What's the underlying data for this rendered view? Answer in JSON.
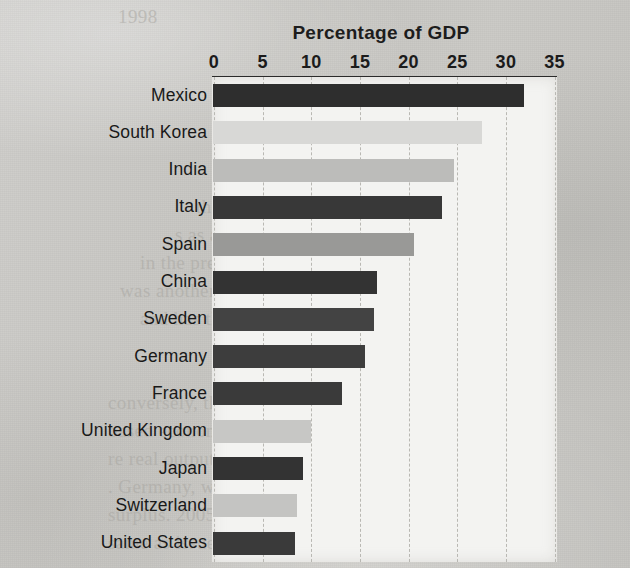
{
  "page": {
    "background_color": "#c9c8c4",
    "plot_background_color": "#f3f3f1",
    "axis_rule_color": "#2b2b2b",
    "gridline_color": "#b9b8b3"
  },
  "bleed_through_text": [
    {
      "text": "1998",
      "x": 118,
      "y": 6
    },
    {
      "text": "is in which economic",
      "x": 300,
      "y": 168
    },
    {
      "text": "the sources of growth in",
      "x": 196,
      "y": 196
    },
    {
      "text": "s as a proportion of GDP",
      "x": 175,
      "y": 224
    },
    {
      "text": "in the previous decade. In Germany, Ch",
      "x": 140,
      "y": 252
    },
    {
      "text": "was another record year for investment. 2005 repr",
      "x": 120,
      "y": 280
    },
    {
      "text": "and has the fastest domestic savings rate",
      "x": 140,
      "y": 308
    },
    {
      "text": "Figure 3",
      "x": 240,
      "y": 336
    },
    {
      "text": "conversely, the rise in investment spending",
      "x": 108,
      "y": 392
    },
    {
      "text": "based economy, DP growth",
      "x": 108,
      "y": 420
    },
    {
      "text": "re real output. So the gap",
      "x": 108,
      "y": 448
    },
    {
      "text": ". Germany, where growth in",
      "x": 108,
      "y": 476
    },
    {
      "text": "surplus. 2005 prices have",
      "x": 108,
      "y": 504
    },
    {
      "text": "same as issues of world",
      "x": 108,
      "y": 532
    }
  ],
  "chart_data": {
    "type": "bar",
    "orientation": "horizontal",
    "title": "Percentage of GDP",
    "xlabel": "",
    "ylabel": "",
    "xlim": [
      0,
      35
    ],
    "xticks": [
      0,
      5,
      10,
      15,
      20,
      25,
      30,
      35
    ],
    "xtick_labels": [
      "0",
      "5",
      "10",
      "15",
      "20",
      "25",
      "30",
      "35"
    ],
    "grid": "vertical-dashed",
    "legend": "none",
    "categories": [
      "Mexico",
      "South Korea",
      "India",
      "Italy",
      "Spain",
      "China",
      "Sweden",
      "Germany",
      "France",
      "United Kingdom",
      "Japan",
      "Switzerland",
      "United States"
    ],
    "values": [
      32.0,
      27.6,
      24.8,
      23.5,
      20.7,
      16.9,
      16.5,
      15.6,
      13.3,
      10.1,
      9.2,
      8.6,
      8.4
    ],
    "bar_colors": [
      "#2e2e2e",
      "#d8d8d6",
      "#bcbcba",
      "#383838",
      "#999997",
      "#333333",
      "#434343",
      "#3d3d3d",
      "#3a3a3a",
      "#c7c7c5",
      "#333333",
      "#c4c4c2",
      "#3a3a3a"
    ]
  }
}
